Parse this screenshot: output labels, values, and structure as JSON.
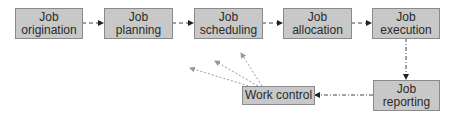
{
  "diagram": {
    "nodes": [
      {
        "id": "origination",
        "line1": "Job",
        "line2": "origination"
      },
      {
        "id": "planning",
        "line1": "Job",
        "line2": "planning"
      },
      {
        "id": "scheduling",
        "line1": "Job",
        "line2": "scheduling"
      },
      {
        "id": "allocation",
        "line1": "Job",
        "line2": "allocation"
      },
      {
        "id": "execution",
        "line1": "Job",
        "line2": "execution"
      },
      {
        "id": "reporting",
        "line1": "Job",
        "line2": "reporting"
      },
      {
        "id": "work_control",
        "label": "Work control"
      }
    ],
    "edges": [
      {
        "from": "origination",
        "to": "planning",
        "style": "dashed"
      },
      {
        "from": "planning",
        "to": "scheduling",
        "style": "dashed"
      },
      {
        "from": "scheduling",
        "to": "allocation",
        "style": "dashed"
      },
      {
        "from": "allocation",
        "to": "execution",
        "style": "dashed"
      },
      {
        "from": "execution",
        "to": "reporting",
        "style": "dash-dot"
      },
      {
        "from": "reporting",
        "to": "work_control",
        "style": "dash-dot"
      },
      {
        "from": "work_control",
        "to": "feedback-1",
        "style": "dotted-gray"
      },
      {
        "from": "work_control",
        "to": "feedback-2",
        "style": "dotted-gray"
      },
      {
        "from": "work_control",
        "to": "feedback-3",
        "style": "dotted-gray"
      }
    ],
    "colors": {
      "box_fill": "#c8c8c8",
      "box_border": "#8a8a8a",
      "arrow": "#333333",
      "feedback_arrow": "#9a9a9a"
    }
  }
}
